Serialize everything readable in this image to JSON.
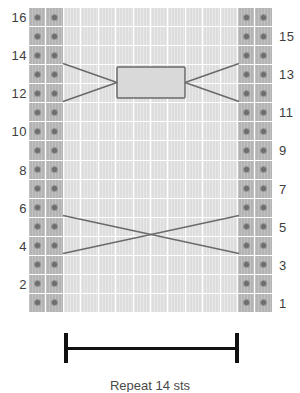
{
  "chart_data": {
    "type": "table",
    "grid": {
      "rows": 16,
      "columns": 14,
      "row_order": "bottom-to-top",
      "legend": {
        "purl_symbol": "dot",
        "purl_label": "purl stitch",
        "knit_label": "knit stitch (blank)"
      },
      "column_types": [
        "purl",
        "purl",
        "knit",
        "knit",
        "knit",
        "knit",
        "knit",
        "knit",
        "knit",
        "knit",
        "knit",
        "knit",
        "purl",
        "purl"
      ]
    },
    "row_numbers": {
      "left_label_rows": [
        16,
        14,
        12,
        10,
        8,
        6,
        4,
        2
      ],
      "right_label_rows": [
        15,
        13,
        11,
        9,
        7,
        5,
        3,
        1
      ],
      "left_labels": [
        "16",
        "14",
        "12",
        "10",
        "8",
        "6",
        "4",
        "2"
      ],
      "right_labels": [
        "15",
        "13",
        "11",
        "9",
        "7",
        "5",
        "3",
        "1"
      ]
    },
    "cables": [
      {
        "name": "upper-cable",
        "row": 13,
        "style": "cross-with-center-hold",
        "has_center_box": true,
        "spans_columns": [
          3,
          12
        ]
      },
      {
        "name": "lower-cable",
        "row": 5,
        "style": "simple-cross",
        "has_center_box": false,
        "spans_columns": [
          3,
          12
        ]
      }
    ],
    "bracket": {
      "label": "",
      "spans_columns": [
        3,
        12
      ],
      "position": "below-chart"
    },
    "colors": {
      "purl_cell": "#b4b4b4",
      "knit_cell": "#dddddd",
      "grid_line": "#ffffff",
      "dot": "#6e6e6e",
      "cable_line": "#6a6a6a",
      "bracket": "#111111",
      "label_text": "#3d3d3d"
    }
  },
  "caption": {
    "text": "Repeat 14 sts"
  }
}
